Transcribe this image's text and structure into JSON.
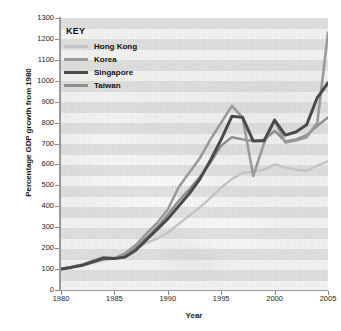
{
  "chart_data": {
    "type": "line",
    "title": "",
    "xlabel": "Year",
    "ylabel": "Percentage GDP growth from 1980",
    "xlim": [
      1980,
      2005
    ],
    "ylim": [
      0,
      1300
    ],
    "ytick_step": 100,
    "xtick_step": 5,
    "grid": false,
    "legend_position": "top-left",
    "yticks": [
      "0",
      "100",
      "200",
      "300",
      "400",
      "500",
      "600",
      "700",
      "800",
      "900",
      "1000",
      "1100",
      "1200",
      "1300"
    ],
    "xticks": [
      "1980",
      "1985",
      "1990",
      "1995",
      "2000",
      "2005"
    ],
    "x": [
      1980,
      1981,
      1982,
      1983,
      1984,
      1985,
      1986,
      1987,
      1988,
      1989,
      1990,
      1991,
      1992,
      1993,
      1994,
      1995,
      1996,
      1997,
      1998,
      1999,
      2000,
      2001,
      2002,
      2003,
      2004,
      2005
    ],
    "series": [
      {
        "name": "Hong Kong",
        "color": "#c3c3c1",
        "width": 2.4,
        "values": [
          100,
          112,
          122,
          130,
          142,
          150,
          165,
          195,
          225,
          245,
          275,
          315,
          355,
          395,
          440,
          490,
          530,
          560,
          565,
          575,
          600,
          585,
          575,
          570,
          595,
          615
        ]
      },
      {
        "name": "Korea",
        "color": "#9a9a98",
        "width": 2.6,
        "values": [
          100,
          110,
          122,
          140,
          158,
          152,
          175,
          215,
          270,
          320,
          385,
          490,
          560,
          630,
          720,
          800,
          880,
          825,
          545,
          700,
          810,
          705,
          715,
          730,
          800,
          1230
        ]
      },
      {
        "name": "Singapore",
        "color": "#4a4a48",
        "width": 3.0,
        "values": [
          100,
          108,
          118,
          135,
          152,
          150,
          158,
          190,
          240,
          290,
          340,
          400,
          460,
          530,
          620,
          720,
          830,
          825,
          712,
          713,
          812,
          740,
          755,
          790,
          920,
          990
        ]
      },
      {
        "name": "Taiwan",
        "color": "#8e8e8c",
        "width": 2.4,
        "values": [
          100,
          110,
          120,
          135,
          148,
          150,
          170,
          205,
          250,
          300,
          360,
          425,
          480,
          540,
          610,
          690,
          730,
          720,
          712,
          718,
          760,
          710,
          720,
          740,
          785,
          825
        ]
      }
    ]
  },
  "legend": {
    "title": "KEY",
    "items": [
      {
        "label": "Hong Kong"
      },
      {
        "label": "Korea"
      },
      {
        "label": "Singapore"
      },
      {
        "label": "Taiwan"
      }
    ]
  }
}
